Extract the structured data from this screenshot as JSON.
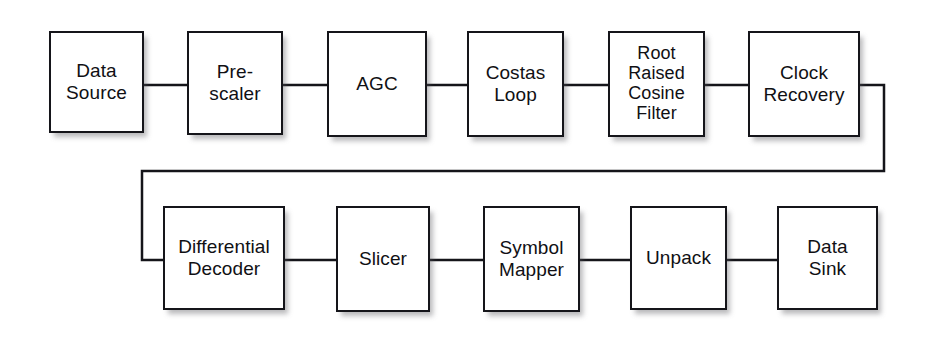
{
  "diagram": {
    "type": "block-diagram",
    "background_color": "#ffffff",
    "block_border_color": "#15151a",
    "block_fill_color": "#ffffff",
    "wire_color": "#15151a",
    "text_color": "#101014",
    "blocks": [
      {
        "id": "data-source",
        "label": "Data\nSource",
        "x": 49,
        "y": 31,
        "w": 95,
        "h": 102,
        "row": "top"
      },
      {
        "id": "pre-scaler",
        "label": "Pre-\nscaler",
        "x": 187,
        "y": 31,
        "w": 96,
        "h": 104,
        "row": "top"
      },
      {
        "id": "agc",
        "label": "AGC",
        "x": 327,
        "y": 31,
        "w": 100,
        "h": 106,
        "row": "top"
      },
      {
        "id": "costas-loop",
        "label": "Costas\nLoop",
        "x": 467,
        "y": 31,
        "w": 97,
        "h": 106,
        "row": "top"
      },
      {
        "id": "rrc-filter",
        "label": "Root\nRaised\nCosine\nFilter",
        "x": 608,
        "y": 31,
        "w": 97,
        "h": 106,
        "row": "top"
      },
      {
        "id": "clock-recovery",
        "label": "Clock\nRecovery",
        "x": 748,
        "y": 31,
        "w": 112,
        "h": 106,
        "row": "top"
      },
      {
        "id": "differential-decoder",
        "label": "Differential\nDecoder",
        "x": 163,
        "y": 206,
        "w": 122,
        "h": 104,
        "row": "bottom"
      },
      {
        "id": "slicer",
        "label": "Slicer",
        "x": 336,
        "y": 206,
        "w": 94,
        "h": 106,
        "row": "bottom"
      },
      {
        "id": "symbol-mapper",
        "label": "Symbol\nMapper",
        "x": 483,
        "y": 206,
        "w": 97,
        "h": 106,
        "row": "bottom"
      },
      {
        "id": "unpack",
        "label": "Unpack",
        "x": 630,
        "y": 206,
        "w": 97,
        "h": 104,
        "row": "bottom"
      },
      {
        "id": "data-sink",
        "label": "Data\nSink",
        "x": 777,
        "y": 206,
        "w": 101,
        "h": 104,
        "row": "bottom"
      }
    ],
    "connections": [
      {
        "id": "conn-data-source-pre-scaler",
        "from": "data-source",
        "to": "pre-scaler",
        "kind": "straight"
      },
      {
        "id": "conn-pre-scaler-agc",
        "from": "pre-scaler",
        "to": "agc",
        "kind": "straight"
      },
      {
        "id": "conn-agc-costas-loop",
        "from": "agc",
        "to": "costas-loop",
        "kind": "straight"
      },
      {
        "id": "conn-costas-loop-rrc-filter",
        "from": "costas-loop",
        "to": "rrc-filter",
        "kind": "straight"
      },
      {
        "id": "conn-rrc-filter-clock-recovery",
        "from": "rrc-filter",
        "to": "clock-recovery",
        "kind": "straight"
      },
      {
        "id": "conn-clock-recovery-differential-decoder",
        "from": "clock-recovery",
        "to": "differential-decoder",
        "kind": "wrap"
      },
      {
        "id": "conn-differential-decoder-slicer",
        "from": "differential-decoder",
        "to": "slicer",
        "kind": "straight"
      },
      {
        "id": "conn-slicer-symbol-mapper",
        "from": "slicer",
        "to": "symbol-mapper",
        "kind": "straight"
      },
      {
        "id": "conn-symbol-mapper-unpack",
        "from": "symbol-mapper",
        "to": "unpack",
        "kind": "straight"
      },
      {
        "id": "conn-unpack-data-sink",
        "from": "unpack",
        "to": "data-sink",
        "kind": "straight"
      }
    ]
  }
}
